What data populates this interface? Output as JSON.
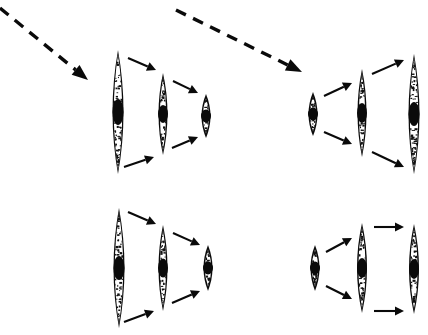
{
  "figure": {
    "background_color": "#ffffff",
    "ink_color": "#0a0a0a",
    "canvas": {
      "width": 428,
      "height": 335
    }
  },
  "chart_data": {
    "type": "diagram",
    "units": "pixels",
    "groups": [
      {
        "id": "group-top-left",
        "label": "Top left group",
        "quadrant": "top-left",
        "progression": "large-to-small",
        "arrow_direction": "converging-right",
        "lenses": [
          {
            "id": "tl-lens-1",
            "size": "large",
            "cx": 118,
            "cy": 112,
            "half_width": 11,
            "half_height": 62,
            "nucleus_rx": 5.5,
            "nucleus_ry": 13
          },
          {
            "id": "tl-lens-2",
            "size": "medium",
            "cx": 163,
            "cy": 114,
            "half_width": 9,
            "half_height": 41,
            "nucleus_rx": 5,
            "nucleus_ry": 9
          },
          {
            "id": "tl-lens-3",
            "size": "small",
            "cx": 206,
            "cy": 116,
            "half_width": 9,
            "half_height": 22,
            "nucleus_rx": 5,
            "nucleus_ry": 6.5
          }
        ],
        "arrows": [
          {
            "id": "tl-arrow-upper-1",
            "x1": 128,
            "y1": 58,
            "x2": 156,
            "y2": 70
          },
          {
            "id": "tl-arrow-upper-2",
            "x1": 173,
            "y1": 81,
            "x2": 198,
            "y2": 93
          },
          {
            "id": "tl-arrow-lower-1",
            "x1": 124,
            "y1": 167,
            "x2": 154,
            "y2": 157
          },
          {
            "id": "tl-arrow-lower-2",
            "x1": 172,
            "y1": 148,
            "x2": 198,
            "y2": 137
          }
        ]
      },
      {
        "id": "group-top-right",
        "label": "Top right group",
        "quadrant": "top-right",
        "progression": "small-to-large",
        "arrow_direction": "diverging-right",
        "lenses": [
          {
            "id": "tr-lens-1",
            "size": "small",
            "cx": 313,
            "cy": 114,
            "half_width": 9,
            "half_height": 22,
            "nucleus_rx": 5,
            "nucleus_ry": 6.5
          },
          {
            "id": "tr-lens-2",
            "size": "medium",
            "cx": 362,
            "cy": 113,
            "half_width": 9,
            "half_height": 44,
            "nucleus_rx": 5,
            "nucleus_ry": 10
          },
          {
            "id": "tr-lens-3",
            "size": "large",
            "cx": 414,
            "cy": 114,
            "half_width": 11,
            "half_height": 60,
            "nucleus_rx": 5.5,
            "nucleus_ry": 12
          }
        ],
        "arrows": [
          {
            "id": "tr-arrow-upper-1",
            "x1": 324,
            "y1": 96,
            "x2": 352,
            "y2": 83
          },
          {
            "id": "tr-arrow-upper-2",
            "x1": 372,
            "y1": 74,
            "x2": 404,
            "y2": 60
          },
          {
            "id": "tr-arrow-lower-1",
            "x1": 324,
            "y1": 132,
            "x2": 352,
            "y2": 144
          },
          {
            "id": "tr-arrow-lower-2",
            "x1": 372,
            "y1": 152,
            "x2": 404,
            "y2": 167
          }
        ]
      },
      {
        "id": "group-bottom-left",
        "label": "Bottom left group",
        "quadrant": "bottom-left",
        "progression": "large-to-small",
        "arrow_direction": "converging-right",
        "lenses": [
          {
            "id": "bl-lens-1",
            "size": "large",
            "cx": 119,
            "cy": 268,
            "half_width": 11,
            "half_height": 60,
            "nucleus_rx": 5.5,
            "nucleus_ry": 12
          },
          {
            "id": "bl-lens-2",
            "size": "medium",
            "cx": 163,
            "cy": 268,
            "half_width": 9,
            "half_height": 43,
            "nucleus_rx": 5,
            "nucleus_ry": 9.5
          },
          {
            "id": "bl-lens-3",
            "size": "small",
            "cx": 208,
            "cy": 268,
            "half_width": 9,
            "half_height": 23,
            "nucleus_rx": 5,
            "nucleus_ry": 6.5
          }
        ],
        "arrows": [
          {
            "id": "bl-arrow-upper-1",
            "x1": 128,
            "y1": 212,
            "x2": 156,
            "y2": 224
          },
          {
            "id": "bl-arrow-upper-2",
            "x1": 173,
            "y1": 233,
            "x2": 200,
            "y2": 245
          },
          {
            "id": "bl-arrow-lower-1",
            "x1": 124,
            "y1": 322,
            "x2": 154,
            "y2": 311
          },
          {
            "id": "bl-arrow-lower-2",
            "x1": 172,
            "y1": 303,
            "x2": 200,
            "y2": 291
          }
        ]
      },
      {
        "id": "group-bottom-right",
        "label": "Bottom right group",
        "quadrant": "bottom-right",
        "progression": "small-to-large",
        "arrow_direction": "diverging-then-parallel-right",
        "lenses": [
          {
            "id": "br-lens-1",
            "size": "small",
            "cx": 315,
            "cy": 268,
            "half_width": 9,
            "half_height": 23,
            "nucleus_rx": 5,
            "nucleus_ry": 6.5
          },
          {
            "id": "br-lens-2",
            "size": "medium",
            "cx": 362,
            "cy": 268,
            "half_width": 10,
            "half_height": 45,
            "nucleus_rx": 5,
            "nucleus_ry": 10
          },
          {
            "id": "br-lens-3",
            "size": "large",
            "cx": 414,
            "cy": 269,
            "half_width": 10,
            "half_height": 45,
            "nucleus_rx": 5,
            "nucleus_ry": 10
          }
        ],
        "arrows": [
          {
            "id": "br-arrow-upper-1",
            "x1": 326,
            "y1": 252,
            "x2": 352,
            "y2": 238
          },
          {
            "id": "br-arrow-upper-2",
            "x1": 374,
            "y1": 227,
            "x2": 404,
            "y2": 227
          },
          {
            "id": "br-arrow-lower-1",
            "x1": 326,
            "y1": 286,
            "x2": 352,
            "y2": 299
          },
          {
            "id": "br-arrow-lower-2",
            "x1": 374,
            "y1": 311,
            "x2": 404,
            "y2": 311
          }
        ]
      }
    ],
    "dashed_arrows": [
      {
        "id": "dashed-arrow-left",
        "label": "Incoming dashed arrow, upper left",
        "x1": 0,
        "y1": 8,
        "x2": 88,
        "y2": 80
      },
      {
        "id": "dashed-arrow-right",
        "label": "Incoming dashed arrow, upper middle",
        "x1": 176,
        "y1": 10,
        "x2": 302,
        "y2": 72
      }
    ]
  }
}
